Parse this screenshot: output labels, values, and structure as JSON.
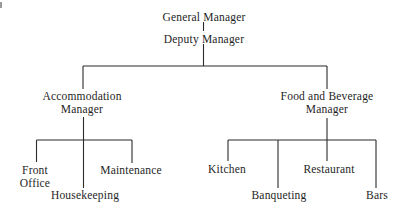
{
  "org_chart": {
    "root": {
      "id": "general-manager",
      "label": "General Manager",
      "children": [
        {
          "id": "deputy-manager",
          "label": "Deputy Manager",
          "children": [
            {
              "id": "accommodation-manager",
              "label": "Accommodation\nManager",
              "children": [
                {
                  "id": "front-office",
                  "label": "Front\nOffice"
                },
                {
                  "id": "housekeeping",
                  "label": "Housekeeping"
                },
                {
                  "id": "maintenance",
                  "label": "Maintenance"
                }
              ]
            },
            {
              "id": "food-and-beverage-manager",
              "label": "Food and Beverage\nManager",
              "children": [
                {
                  "id": "kitchen",
                  "label": "Kitchen"
                },
                {
                  "id": "banqueting",
                  "label": "Banqueting"
                },
                {
                  "id": "restaurant",
                  "label": "Restaurant"
                },
                {
                  "id": "bars",
                  "label": "Bars"
                }
              ]
            }
          ]
        }
      ]
    }
  },
  "nodes": {
    "general_manager": "General Manager",
    "deputy_manager": "Deputy Manager",
    "accommodation_manager_line1": "Accommodation",
    "accommodation_manager_line2": "Manager",
    "fb_manager_line1": "Food and Beverage",
    "fb_manager_line2": "Manager",
    "front_office_line1": "Front",
    "front_office_line2": "Office",
    "housekeeping": "Housekeeping",
    "maintenance": "Maintenance",
    "kitchen": "Kitchen",
    "banqueting": "Banqueting",
    "restaurant": "Restaurant",
    "bars": "Bars"
  },
  "colors": {
    "text": "#1e1e1e",
    "lines": "#2a2a2a",
    "background": "#ffffff"
  }
}
